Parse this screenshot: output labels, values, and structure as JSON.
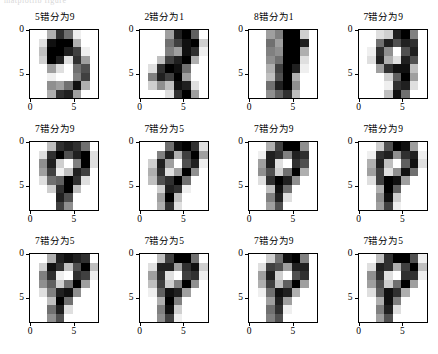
{
  "figure": {
    "top_clipped_text": "matplotlib figure",
    "rows": 3,
    "cols": 4,
    "background": "#ffffff",
    "colormap": "gray_r"
  },
  "axis": {
    "xticks": [
      "0",
      "5"
    ],
    "yticks": [
      "0",
      "5"
    ],
    "xtick_values": [
      0,
      5
    ],
    "ytick_values": [
      0,
      5
    ],
    "xlabel": "",
    "ylabel": "",
    "grid": false,
    "image_extent": [
      0,
      8,
      8,
      0
    ]
  },
  "chart_data": {
    "type": "heatmap",
    "title": "",
    "subtitle": "",
    "xlabel": "",
    "ylabel": "",
    "grid": false,
    "legend_position": "none",
    "colormap": "gray_r",
    "value_range": [
      0,
      16
    ],
    "cell_size": [
      8,
      8
    ],
    "panels": [
      {
        "row": 0,
        "col": 0,
        "title": "5错分为9",
        "true_label": 5,
        "predicted_label": 9,
        "values": [
          [
            0,
            0,
            5,
            13,
            9,
            1,
            0,
            0
          ],
          [
            0,
            2,
            15,
            16,
            16,
            5,
            0,
            0
          ],
          [
            0,
            4,
            16,
            16,
            14,
            12,
            1,
            0
          ],
          [
            0,
            3,
            16,
            14,
            2,
            13,
            6,
            0
          ],
          [
            0,
            0,
            6,
            2,
            0,
            9,
            11,
            0
          ],
          [
            0,
            0,
            1,
            0,
            0,
            8,
            12,
            0
          ],
          [
            0,
            0,
            7,
            6,
            9,
            15,
            5,
            0
          ],
          [
            0,
            0,
            5,
            13,
            14,
            6,
            0,
            0
          ]
        ]
      },
      {
        "row": 0,
        "col": 1,
        "title": "2错分为1",
        "true_label": 2,
        "predicted_label": 1,
        "values": [
          [
            0,
            0,
            0,
            6,
            14,
            16,
            10,
            0
          ],
          [
            0,
            0,
            0,
            9,
            12,
            15,
            16,
            3
          ],
          [
            0,
            0,
            0,
            8,
            6,
            15,
            13,
            1
          ],
          [
            0,
            0,
            4,
            12,
            14,
            16,
            5,
            0
          ],
          [
            0,
            2,
            13,
            16,
            15,
            9,
            0,
            0
          ],
          [
            0,
            8,
            14,
            12,
            16,
            6,
            0,
            0
          ],
          [
            0,
            3,
            7,
            4,
            15,
            14,
            2,
            0
          ],
          [
            0,
            0,
            0,
            2,
            13,
            16,
            6,
            0
          ]
        ]
      },
      {
        "row": 0,
        "col": 2,
        "title": "8错分为1",
        "true_label": 8,
        "predicted_label": 1,
        "values": [
          [
            0,
            0,
            6,
            8,
            16,
            16,
            3,
            0
          ],
          [
            0,
            0,
            9,
            6,
            16,
            16,
            14,
            0
          ],
          [
            0,
            0,
            8,
            7,
            16,
            16,
            5,
            0
          ],
          [
            0,
            0,
            7,
            9,
            16,
            16,
            2,
            0
          ],
          [
            0,
            0,
            5,
            12,
            16,
            14,
            1,
            0
          ],
          [
            0,
            0,
            4,
            11,
            16,
            5,
            0,
            0
          ],
          [
            0,
            0,
            9,
            14,
            16,
            7,
            0,
            0
          ],
          [
            0,
            0,
            7,
            10,
            13,
            4,
            0,
            0
          ]
        ]
      },
      {
        "row": 0,
        "col": 3,
        "title": "7错分为9",
        "true_label": 7,
        "predicted_label": 9,
        "values": [
          [
            0,
            0,
            2,
            3,
            14,
            16,
            8,
            0
          ],
          [
            0,
            0,
            9,
            14,
            11,
            14,
            13,
            0
          ],
          [
            0,
            1,
            13,
            7,
            0,
            11,
            14,
            0
          ],
          [
            0,
            2,
            14,
            5,
            2,
            14,
            11,
            0
          ],
          [
            0,
            0,
            6,
            13,
            15,
            15,
            4,
            0
          ],
          [
            0,
            0,
            0,
            3,
            10,
            16,
            6,
            0
          ],
          [
            0,
            0,
            0,
            1,
            13,
            14,
            2,
            0
          ],
          [
            0,
            0,
            0,
            4,
            15,
            9,
            0,
            0
          ]
        ]
      },
      {
        "row": 1,
        "col": 0,
        "title": "7错分为9",
        "true_label": 7,
        "predicted_label": 9,
        "values": [
          [
            0,
            0,
            4,
            13,
            14,
            13,
            9,
            0
          ],
          [
            0,
            2,
            13,
            16,
            11,
            14,
            16,
            2
          ],
          [
            0,
            7,
            14,
            3,
            0,
            8,
            16,
            2
          ],
          [
            0,
            6,
            12,
            1,
            4,
            14,
            12,
            0
          ],
          [
            0,
            2,
            9,
            10,
            16,
            13,
            2,
            0
          ],
          [
            0,
            0,
            3,
            13,
            16,
            4,
            0,
            0
          ],
          [
            0,
            0,
            0,
            14,
            11,
            0,
            0,
            0
          ],
          [
            0,
            0,
            0,
            12,
            7,
            0,
            0,
            0
          ]
        ]
      },
      {
        "row": 1,
        "col": 1,
        "title": "7错分为5",
        "true_label": 7,
        "predicted_label": 5,
        "values": [
          [
            0,
            0,
            0,
            9,
            15,
            16,
            13,
            2
          ],
          [
            0,
            0,
            8,
            14,
            5,
            12,
            16,
            6
          ],
          [
            0,
            3,
            14,
            6,
            0,
            11,
            14,
            1
          ],
          [
            0,
            5,
            13,
            2,
            6,
            16,
            7,
            0
          ],
          [
            0,
            4,
            11,
            13,
            16,
            9,
            0,
            0
          ],
          [
            0,
            0,
            3,
            14,
            13,
            1,
            0,
            0
          ],
          [
            0,
            0,
            6,
            16,
            4,
            0,
            0,
            0
          ],
          [
            0,
            0,
            5,
            13,
            2,
            0,
            0,
            0
          ]
        ]
      },
      {
        "row": 1,
        "col": 2,
        "title": "7错分为9",
        "true_label": 7,
        "predicted_label": 9,
        "values": [
          [
            0,
            0,
            5,
            12,
            16,
            16,
            7,
            0
          ],
          [
            0,
            1,
            14,
            13,
            8,
            14,
            13,
            0
          ],
          [
            0,
            6,
            14,
            2,
            0,
            13,
            11,
            0
          ],
          [
            0,
            7,
            11,
            3,
            9,
            16,
            5,
            0
          ],
          [
            0,
            2,
            13,
            16,
            14,
            7,
            0,
            0
          ],
          [
            0,
            0,
            4,
            15,
            9,
            0,
            0,
            0
          ],
          [
            0,
            0,
            8,
            14,
            2,
            0,
            0,
            0
          ],
          [
            0,
            0,
            6,
            11,
            0,
            0,
            0,
            0
          ]
        ]
      },
      {
        "row": 1,
        "col": 3,
        "title": "7错分为9",
        "true_label": 7,
        "predicted_label": 9,
        "values": [
          [
            0,
            0,
            3,
            11,
            16,
            15,
            6,
            0
          ],
          [
            0,
            1,
            13,
            14,
            7,
            13,
            14,
            1
          ],
          [
            0,
            5,
            14,
            4,
            0,
            10,
            15,
            2
          ],
          [
            0,
            6,
            12,
            2,
            7,
            15,
            9,
            0
          ],
          [
            0,
            2,
            12,
            16,
            15,
            6,
            0,
            0
          ],
          [
            0,
            0,
            5,
            16,
            10,
            0,
            0,
            0
          ],
          [
            0,
            0,
            7,
            15,
            3,
            0,
            0,
            0
          ],
          [
            0,
            0,
            6,
            12,
            1,
            0,
            0,
            0
          ]
        ]
      },
      {
        "row": 2,
        "col": 0,
        "title": "7错分为5",
        "true_label": 7,
        "predicted_label": 5,
        "values": [
          [
            0,
            0,
            5,
            14,
            15,
            14,
            13,
            0
          ],
          [
            0,
            3,
            15,
            13,
            4,
            11,
            16,
            4
          ],
          [
            0,
            8,
            13,
            1,
            0,
            13,
            12,
            1
          ],
          [
            0,
            7,
            10,
            3,
            9,
            16,
            6,
            0
          ],
          [
            0,
            2,
            8,
            14,
            15,
            7,
            0,
            0
          ],
          [
            0,
            0,
            4,
            16,
            9,
            0,
            0,
            0
          ],
          [
            0,
            0,
            9,
            14,
            2,
            0,
            0,
            0
          ],
          [
            0,
            0,
            7,
            11,
            0,
            0,
            0,
            0
          ]
        ]
      },
      {
        "row": 2,
        "col": 1,
        "title": "7错分为5",
        "true_label": 7,
        "predicted_label": 5,
        "values": [
          [
            0,
            0,
            4,
            12,
            16,
            16,
            9,
            0
          ],
          [
            0,
            2,
            14,
            14,
            6,
            13,
            15,
            3
          ],
          [
            0,
            6,
            13,
            2,
            0,
            12,
            13,
            1
          ],
          [
            0,
            4,
            12,
            3,
            8,
            16,
            7,
            0
          ],
          [
            0,
            1,
            10,
            15,
            14,
            6,
            0,
            0
          ],
          [
            0,
            0,
            5,
            16,
            8,
            0,
            0,
            0
          ],
          [
            0,
            0,
            8,
            15,
            3,
            0,
            0,
            0
          ],
          [
            0,
            0,
            7,
            12,
            1,
            0,
            0,
            0
          ]
        ]
      },
      {
        "row": 2,
        "col": 2,
        "title": "7错分为9",
        "true_label": 7,
        "predicted_label": 9,
        "values": [
          [
            0,
            0,
            3,
            9,
            15,
            16,
            8,
            0
          ],
          [
            0,
            2,
            12,
            11,
            6,
            14,
            14,
            0
          ],
          [
            0,
            6,
            14,
            3,
            0,
            11,
            13,
            0
          ],
          [
            0,
            5,
            12,
            4,
            10,
            16,
            6,
            0
          ],
          [
            0,
            1,
            9,
            15,
            14,
            5,
            0,
            0
          ],
          [
            0,
            0,
            6,
            14,
            6,
            0,
            0,
            0
          ],
          [
            0,
            0,
            9,
            13,
            1,
            0,
            0,
            0
          ],
          [
            0,
            0,
            8,
            11,
            0,
            0,
            0,
            0
          ]
        ]
      },
      {
        "row": 2,
        "col": 3,
        "title": "7错分为5",
        "true_label": 7,
        "predicted_label": 5,
        "values": [
          [
            0,
            0,
            4,
            13,
            16,
            16,
            11,
            1
          ],
          [
            0,
            2,
            14,
            13,
            5,
            12,
            16,
            4
          ],
          [
            0,
            7,
            13,
            2,
            0,
            13,
            13,
            1
          ],
          [
            0,
            6,
            11,
            3,
            9,
            16,
            6,
            0
          ],
          [
            0,
            2,
            10,
            15,
            13,
            5,
            0,
            0
          ],
          [
            0,
            0,
            5,
            15,
            8,
            0,
            0,
            0
          ],
          [
            0,
            0,
            8,
            14,
            2,
            0,
            0,
            0
          ],
          [
            0,
            0,
            6,
            11,
            0,
            0,
            0,
            0
          ]
        ]
      }
    ]
  }
}
